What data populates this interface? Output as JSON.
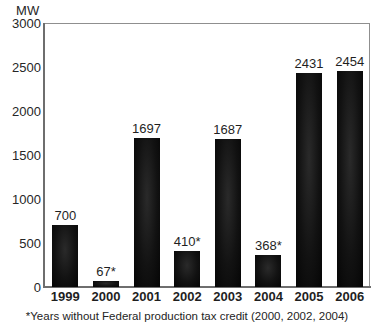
{
  "title_sliver": "",
  "unit_label": "MW",
  "footnote": "*Years without Federal production tax credit (2000, 2002, 2004)",
  "axis": {
    "y_ticks": [
      "3000",
      "2500",
      "2000",
      "1500",
      "1000",
      "500",
      "0"
    ],
    "x_ticks": [
      "1999",
      "2000",
      "2001",
      "2002",
      "2003",
      "2004",
      "2005",
      "2006"
    ]
  },
  "bar_labels": [
    "700",
    "67*",
    "1697",
    "410*",
    "1687",
    "368*",
    "2431",
    "2454"
  ],
  "colors": {
    "bar": "#0c0c0c",
    "frame": "#8f8f8f",
    "axis": "#6e6e6e",
    "text": "#1f1f1f",
    "background": "#ffffff"
  },
  "chart_data": {
    "type": "bar",
    "title": "",
    "xlabel": "",
    "ylabel": "MW",
    "ylim": [
      0,
      3000
    ],
    "ytick_values": [
      0,
      500,
      1000,
      1500,
      2000,
      2500,
      3000
    ],
    "grid": false,
    "legend": "none",
    "categories": [
      "1999",
      "2000",
      "2001",
      "2002",
      "2003",
      "2004",
      "2005",
      "2006"
    ],
    "values": [
      700,
      67,
      1697,
      410,
      1687,
      368,
      2431,
      2454
    ],
    "data_labels": [
      "700",
      "67*",
      "1697",
      "410*",
      "1687",
      "368*",
      "2431",
      "2454"
    ],
    "annotations": [
      "*Years without Federal production tax credit (2000, 2002, 2004)"
    ]
  }
}
